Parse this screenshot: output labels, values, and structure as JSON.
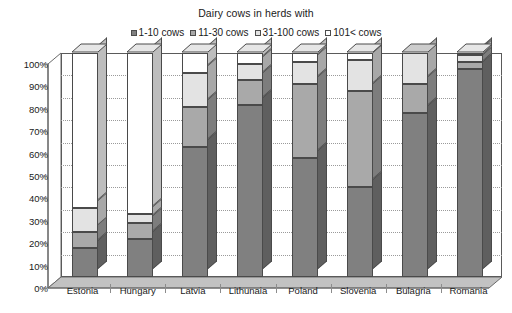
{
  "chart_data": {
    "type": "bar",
    "subtype": "stacked-column-3d",
    "title": "Dairy cows in herds with",
    "xlabel": "",
    "ylabel": "",
    "ylim": [
      0,
      100
    ],
    "yunit": "%",
    "grid": true,
    "legend_position": "top-center",
    "stacked": true,
    "stack_total": 100,
    "categories": [
      "Estonia",
      "Hungary",
      "Latvia",
      "Lithunaia",
      "Poland",
      "Slovenia",
      "Bulagria",
      "Romania"
    ],
    "ytick_labels": [
      "0%",
      "10%",
      "20%",
      "30%",
      "40%",
      "50%",
      "60%",
      "70%",
      "80%",
      "90%",
      "100%"
    ],
    "ytick_values": [
      0,
      10,
      20,
      30,
      40,
      50,
      60,
      70,
      80,
      90,
      100
    ],
    "series": [
      {
        "name": "1-10 cows",
        "color": "#808080",
        "values": [
          13,
          17,
          58,
          77,
          53,
          40,
          73,
          93
        ]
      },
      {
        "name": "11-30 cows",
        "color": "#a9a9a9",
        "values": [
          7,
          7,
          18,
          11,
          33,
          43,
          13,
          3
        ]
      },
      {
        "name": "31-100 cows",
        "color": "#e3e3e3",
        "values": [
          11,
          4,
          15,
          7,
          10,
          14,
          14,
          3
        ]
      },
      {
        "name": "101< cows",
        "color": "#ffffff",
        "values": [
          69,
          72,
          9,
          5,
          4,
          3,
          0,
          1
        ]
      }
    ]
  },
  "legend": {
    "items": [
      {
        "label": "1-10 cows",
        "color": "#808080"
      },
      {
        "label": "11-30 cows",
        "color": "#a9a9a9"
      },
      {
        "label": "31-100 cows",
        "color": "#e3e3e3"
      },
      {
        "label": "101< cows",
        "color": "#ffffff"
      }
    ]
  },
  "style": {
    "axis_color": "#5a5a5a",
    "grid_color": "#9a9a9a",
    "floor_fill": "#bdbdbd",
    "side_shade": "#6f6f6f",
    "text_color": "#1a1a1a"
  }
}
